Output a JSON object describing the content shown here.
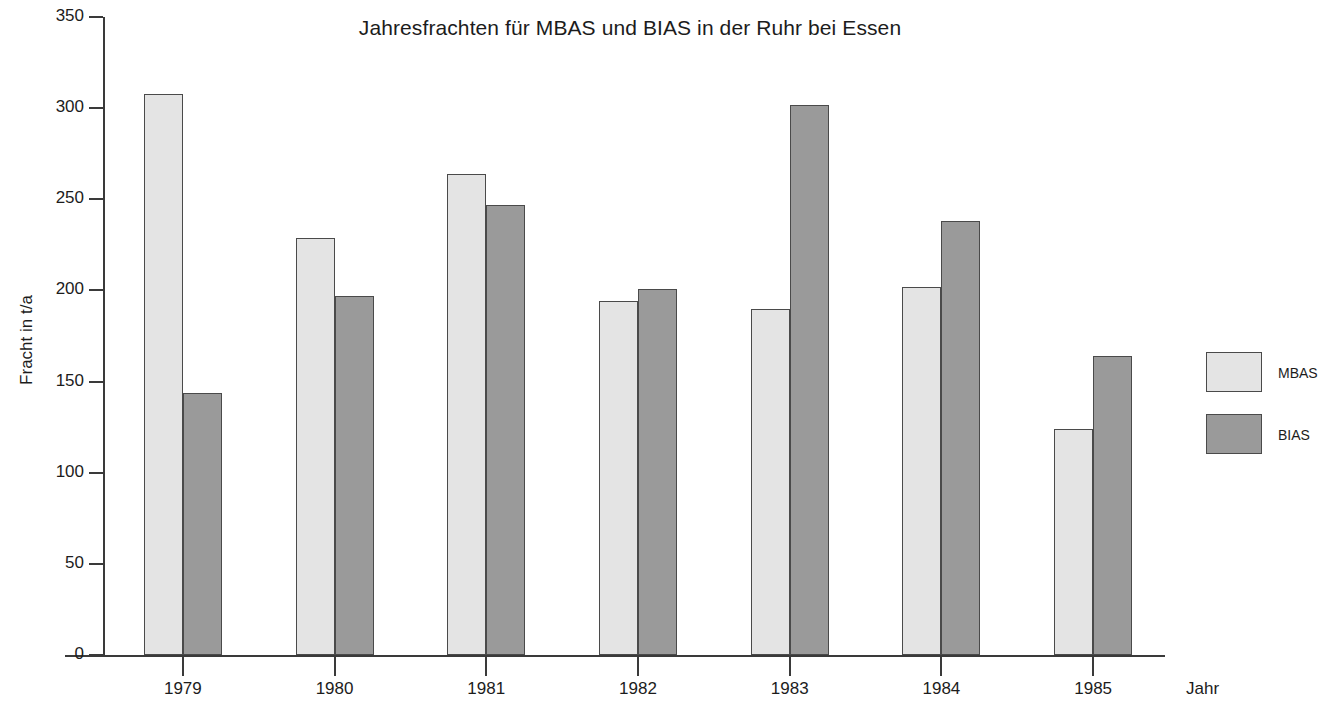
{
  "chart_data": {
    "type": "bar",
    "title": "Jahresfrachten für MBAS und BIAS in der Ruhr bei Essen",
    "xlabel": "Jahr",
    "ylabel": "Fracht in t/a",
    "categories": [
      "1979",
      "1980",
      "1981",
      "1982",
      "1983",
      "1984",
      "1985"
    ],
    "series": [
      {
        "name": "MBAS",
        "color": "#e4e4e4",
        "values": [
          308,
          229,
          264,
          194,
          190,
          202,
          124
        ]
      },
      {
        "name": "BIAS",
        "color": "#9a9a9a",
        "values": [
          144,
          197,
          247,
          201,
          302,
          238,
          164
        ]
      }
    ],
    "ylim": [
      0,
      350
    ],
    "yticks": [
      0,
      50,
      100,
      150,
      200,
      250,
      300,
      350
    ],
    "ytick_labels": [
      "0",
      "50",
      "100",
      "150",
      "200",
      "250",
      "300",
      "350"
    ],
    "grid": false,
    "legend_position": "right"
  },
  "legend": {
    "entries": [
      {
        "label": "MBAS"
      },
      {
        "label": "BIAS"
      }
    ]
  }
}
